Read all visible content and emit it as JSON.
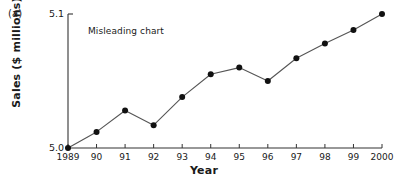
{
  "figure": {
    "panel_label": "(a)",
    "annotation": "Misleading chart",
    "annotation_x": 88,
    "annotation_y": 26
  },
  "chart_data": {
    "type": "line",
    "title": "",
    "subtitle": "",
    "annotations": [
      "Misleading chart"
    ],
    "xlabel": "Year",
    "ylabel": "Sales ($ millions)",
    "categories": [
      "1989",
      "90",
      "91",
      "92",
      "93",
      "94",
      "95",
      "96",
      "97",
      "98",
      "99",
      "2000"
    ],
    "x": [
      1989,
      1990,
      1991,
      1992,
      1993,
      1994,
      1995,
      1996,
      1997,
      1998,
      1999,
      2000
    ],
    "values": [
      5.0,
      5.012,
      5.028,
      5.017,
      5.038,
      5.055,
      5.06,
      5.05,
      5.067,
      5.078,
      5.088,
      5.1
    ],
    "ylim": [
      5.0,
      5.1
    ],
    "ytick_labels": [
      "5.0",
      "5.1"
    ],
    "ytick_values": [
      5.0,
      5.1
    ],
    "xlim": [
      1989,
      2000
    ],
    "grid": false,
    "legend": null,
    "marker": "filled-circle",
    "marker_color": "#111111",
    "line_color": "#555555",
    "axis_color": "#333333"
  },
  "geometry": {
    "plot_left": 68,
    "plot_right": 382,
    "plot_top": 14,
    "plot_bottom": 148
  }
}
